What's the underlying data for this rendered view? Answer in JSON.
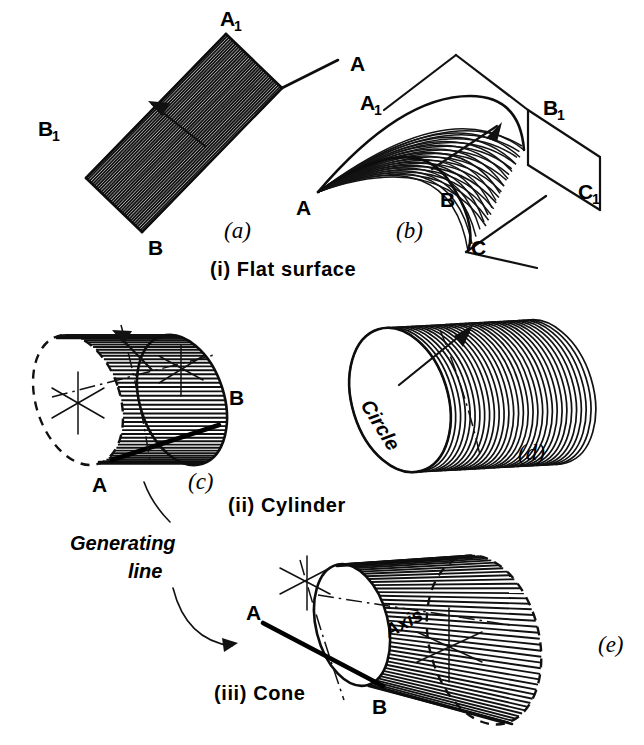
{
  "figure": {
    "background_color": "#ffffff",
    "ink_color": "#111111",
    "width": 644,
    "height": 745
  },
  "sections": [
    {
      "id": "i",
      "label": "(i)  Flat surface"
    },
    {
      "id": "ii",
      "label": "(ii)  Cylinder"
    },
    {
      "id": "iii",
      "label": "(iii) Cone"
    }
  ],
  "panels": {
    "a": {
      "caption": "(a)",
      "description": "flat-plane-ruled-surface",
      "labels": [
        {
          "name": "point-a1-top",
          "text": "A",
          "sub": "1"
        },
        {
          "name": "point-a-right",
          "text": "A",
          "sub": ""
        },
        {
          "name": "point-b1-left",
          "text": "B",
          "sub": "1"
        },
        {
          "name": "point-b-bottom",
          "text": "B",
          "sub": ""
        }
      ]
    },
    "b": {
      "caption": "(b)",
      "description": "curved-ruled-surface-in-prism",
      "labels": [
        {
          "name": "point-a-apex",
          "text": "A",
          "sub": ""
        },
        {
          "name": "point-a1",
          "text": "A",
          "sub": "1"
        },
        {
          "name": "point-b",
          "text": "B",
          "sub": ""
        },
        {
          "name": "point-b1",
          "text": "B",
          "sub": "1"
        },
        {
          "name": "point-c",
          "text": "C",
          "sub": ""
        },
        {
          "name": "point-c1",
          "text": "C",
          "sub": "1"
        }
      ]
    },
    "c": {
      "caption": "(c)",
      "description": "cylinder-generated-by-line-ab",
      "labels": [
        {
          "name": "point-a",
          "text": "A",
          "sub": ""
        },
        {
          "name": "point-b",
          "text": "B",
          "sub": ""
        }
      ]
    },
    "d": {
      "caption": "(d)",
      "description": "cylinder-generated-by-moving-circle",
      "labels": [
        {
          "name": "circle-annotation",
          "text": "Circle"
        }
      ]
    },
    "e": {
      "caption": "(e)",
      "description": "cone-generated-by-line-ab-about-axis",
      "labels": [
        {
          "name": "point-a",
          "text": "A",
          "sub": ""
        },
        {
          "name": "point-b",
          "text": "B",
          "sub": ""
        },
        {
          "name": "axis-annotation",
          "text": "Axis"
        }
      ]
    }
  },
  "annotations": {
    "generating_line_1": "Generating",
    "generating_line_2": "line"
  }
}
